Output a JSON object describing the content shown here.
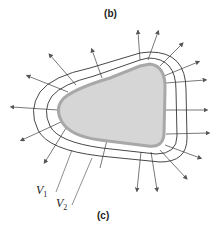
{
  "figure": {
    "top_label": "(b)",
    "bottom_label": "(c)",
    "equipotential_labels": [
      {
        "symbol": "V",
        "subscript": "1"
      },
      {
        "symbol": "V",
        "subscript": "2"
      }
    ],
    "colors": {
      "conductor_fill": "#d6d6d6",
      "conductor_edge": "#a8a8a8",
      "lines": "#333333",
      "arrows": "#555555"
    }
  }
}
